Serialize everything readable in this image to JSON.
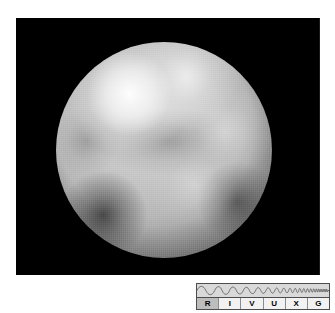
{
  "figure": {
    "panel": {
      "name": "pluto-surface-image",
      "background_color": "#000000",
      "alt_description": "Hubble Space Telescope grayscale image of the disc of Pluto showing a bright north polar cap at upper left, bright mid-latitude regions, and dark maculae at lower left and lower right."
    },
    "subject": {
      "body_type": "planetary disc",
      "surface_tone": "grayscale",
      "features": [
        {
          "name": "bright-polar-cap",
          "position": "upper-left",
          "relative_brightness": "brightest"
        },
        {
          "name": "bright-crest",
          "position": "upper-center",
          "relative_brightness": "bright"
        },
        {
          "name": "bright-band",
          "position": "mid-right",
          "relative_brightness": "bright"
        },
        {
          "name": "bright-patch",
          "position": "lower-center-right",
          "relative_brightness": "bright"
        },
        {
          "name": "dark-macula",
          "position": "lower-left",
          "relative_brightness": "darkest"
        },
        {
          "name": "dark-macula",
          "position": "lower-right",
          "relative_brightness": "dark"
        },
        {
          "name": "dark-equatorial-band",
          "position": "center",
          "relative_brightness": "medium-dark"
        }
      ]
    },
    "wavelength_indicator": {
      "name": "RIVUXG",
      "description": "Electromagnetic spectrum band indicator; wavelength decreases left to right",
      "active_band": "R",
      "bands": [
        {
          "letter": "R",
          "band": "Radio",
          "active": true
        },
        {
          "letter": "I",
          "band": "Infrared",
          "active": false
        },
        {
          "letter": "V",
          "band": "Visible",
          "active": false
        },
        {
          "letter": "U",
          "band": "Ultraviolet",
          "active": false
        },
        {
          "letter": "X",
          "band": "X-ray",
          "active": false
        },
        {
          "letter": "G",
          "band": "Gamma ray",
          "active": false
        }
      ],
      "colors": {
        "wave_row_background": "#d9d9d9",
        "label_row_background": "#f2f2f2",
        "active_cell_background": "#bdbdbd",
        "border": "#4d4d4d",
        "text": "#000000"
      }
    }
  }
}
